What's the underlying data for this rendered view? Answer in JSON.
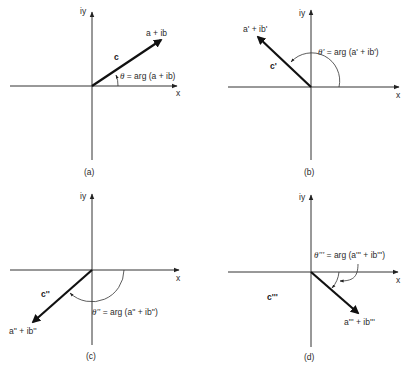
{
  "figure": {
    "panels": [
      {
        "id": "a",
        "caption": "(a)",
        "y_axis_label": "iy",
        "x_axis_label": "x",
        "vector_label": "c",
        "point_label": "a + ib",
        "angle_symbol": "θ",
        "angle_label": " = arg (a + ib)",
        "quadrant": "I"
      },
      {
        "id": "b",
        "caption": "(b)",
        "y_axis_label": "iy",
        "x_axis_label": "x",
        "vector_label": "c'",
        "point_label": "a' + ib'",
        "angle_symbol": "θ'",
        "angle_label": " = arg (a' + ib')",
        "quadrant": "II"
      },
      {
        "id": "c",
        "caption": "(c)",
        "y_axis_label": "iy",
        "x_axis_label": "x",
        "vector_label": "c''",
        "point_label": "a'' + ib''",
        "angle_symbol": "θ''",
        "angle_label": " = arg (a'' + ib'')",
        "quadrant": "III"
      },
      {
        "id": "d",
        "caption": "(d)",
        "y_axis_label": "iy",
        "x_axis_label": "x",
        "vector_label": "c'''",
        "point_label": "a''' + ib'''",
        "angle_symbol": "θ'''",
        "angle_label": " = arg (a''' + ib''')",
        "quadrant": "IV"
      }
    ]
  }
}
